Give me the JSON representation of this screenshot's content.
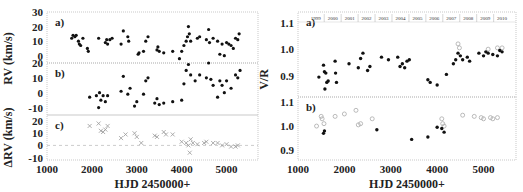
{
  "chart_data": [
    {
      "type": "scatter",
      "panel": "left",
      "xlabel": "HJD 2450000+",
      "xlim": [
        1000,
        5700
      ],
      "xticks": [
        1000,
        2000,
        3000,
        4000,
        5000
      ],
      "subplots": [
        {
          "label": "a)",
          "ylabel": "RV (km/s)",
          "ylim": [
            -5,
            30
          ],
          "yticks": [
            0,
            10,
            20,
            30
          ],
          "points": [
            [
              1550,
              12
            ],
            [
              1580,
              14
            ],
            [
              1620,
              13
            ],
            [
              1650,
              14
            ],
            [
              1700,
              10
            ],
            [
              1720,
              8
            ],
            [
              1750,
              7
            ],
            [
              1800,
              12
            ],
            [
              1900,
              5
            ],
            [
              1920,
              3
            ],
            [
              2150,
              12
            ],
            [
              2300,
              9
            ],
            [
              2330,
              11
            ],
            [
              2350,
              8
            ],
            [
              2400,
              11
            ],
            [
              2450,
              12
            ],
            [
              2650,
              8
            ],
            [
              2700,
              17
            ],
            [
              2800,
              13
            ],
            [
              2820,
              10
            ],
            [
              3030,
              1
            ],
            [
              3050,
              2
            ],
            [
              3150,
              3
            ],
            [
              3200,
              10
            ],
            [
              3250,
              13
            ],
            [
              3450,
              4
            ],
            [
              3470,
              6
            ],
            [
              3500,
              3
            ],
            [
              3600,
              2
            ],
            [
              3800,
              3
            ],
            [
              3950,
              -2
            ],
            [
              4000,
              3
            ],
            [
              4050,
              7
            ],
            [
              4100,
              10
            ],
            [
              4130,
              13
            ],
            [
              4150,
              20
            ],
            [
              4170,
              15
            ],
            [
              4200,
              10
            ],
            [
              4350,
              12
            ],
            [
              4400,
              13
            ],
            [
              4550,
              11
            ],
            [
              4600,
              18
            ],
            [
              4620,
              9
            ],
            [
              4700,
              12
            ],
            [
              4800,
              10
            ],
            [
              4850,
              1
            ],
            [
              4900,
              8
            ],
            [
              4950,
              0
            ],
            [
              5000,
              9
            ],
            [
              5050,
              8
            ],
            [
              5100,
              7
            ],
            [
              5150,
              5
            ],
            [
              5200,
              12
            ],
            [
              5250,
              11
            ],
            [
              5280,
              15
            ]
          ]
        },
        {
          "label": "b)",
          "ylabel": "",
          "ylim": [
            -15,
            20
          ],
          "yticks": [
            -10,
            0,
            10,
            20
          ],
          "points": [
            [
              1950,
              -3
            ],
            [
              2100,
              -2
            ],
            [
              2150,
              -10
            ],
            [
              2170,
              0
            ],
            [
              2200,
              -5
            ],
            [
              2250,
              -2
            ],
            [
              2300,
              -6
            ],
            [
              2350,
              -2
            ],
            [
              2650,
              1
            ],
            [
              2700,
              11
            ],
            [
              2800,
              -1
            ],
            [
              2850,
              3
            ],
            [
              2950,
              -9
            ],
            [
              3000,
              -6
            ],
            [
              3150,
              -1
            ],
            [
              3200,
              8
            ],
            [
              3250,
              10
            ],
            [
              3400,
              -7
            ],
            [
              3450,
              -4
            ],
            [
              3500,
              -8
            ],
            [
              3600,
              -7
            ],
            [
              3800,
              -6
            ],
            [
              4000,
              -5
            ],
            [
              4050,
              6
            ],
            [
              4100,
              15
            ],
            [
              4150,
              19
            ],
            [
              4200,
              12
            ],
            [
              4300,
              8
            ],
            [
              4400,
              12
            ],
            [
              4550,
              10
            ],
            [
              4600,
              20
            ],
            [
              4650,
              9
            ],
            [
              4700,
              5
            ],
            [
              4800,
              -3
            ],
            [
              4850,
              8
            ],
            [
              4900,
              5
            ],
            [
              4950,
              0
            ],
            [
              5000,
              8
            ],
            [
              5100,
              3
            ],
            [
              5200,
              12
            ],
            [
              5250,
              10
            ],
            [
              5300,
              15
            ]
          ]
        },
        {
          "label": "c)",
          "ylabel": "ΔRV (km/s)",
          "ylim": [
            -12,
            25
          ],
          "yticks": [
            -10,
            0,
            10,
            20
          ],
          "points": [
            [
              1950,
              16
            ],
            [
              2150,
              18
            ],
            [
              2200,
              12
            ],
            [
              2250,
              11
            ],
            [
              2300,
              13
            ],
            [
              2350,
              16
            ],
            [
              2650,
              6
            ],
            [
              2750,
              9
            ],
            [
              2950,
              10
            ],
            [
              3000,
              7
            ],
            [
              3100,
              2
            ],
            [
              3400,
              8
            ],
            [
              3450,
              7
            ],
            [
              3600,
              11
            ],
            [
              3650,
              9
            ],
            [
              3800,
              9
            ],
            [
              4000,
              3
            ],
            [
              4100,
              2
            ],
            [
              4150,
              0
            ],
            [
              4180,
              -6
            ],
            [
              4200,
              5
            ],
            [
              4250,
              2
            ],
            [
              4350,
              1
            ],
            [
              4500,
              2
            ],
            [
              4550,
              3
            ],
            [
              4700,
              2
            ],
            [
              4800,
              2
            ],
            [
              4900,
              0
            ],
            [
              5000,
              1
            ],
            [
              5100,
              -1
            ],
            [
              5200,
              -1
            ],
            [
              5250,
              0
            ]
          ]
        }
      ]
    },
    {
      "type": "scatter",
      "panel": "right",
      "xlabel": "HJD 2450000+",
      "xlim": [
        1000,
        5700
      ],
      "xticks": [
        1000,
        2000,
        3000,
        4000,
        5000
      ],
      "years": [
        "1999",
        "2000",
        "2001",
        "2002",
        "2003",
        "2004",
        "2005",
        "2006",
        "2007",
        "2008",
        "2009",
        "2010"
      ],
      "subplots": [
        {
          "label": "a)",
          "ylabel": "V/R",
          "ylim": [
            0.82,
            1.14
          ],
          "yticks": [
            0.9,
            1.0,
            1.1
          ],
          "filled": [
            [
              1450,
              0.895
            ],
            [
              1550,
              0.94
            ],
            [
              1570,
              0.915
            ],
            [
              1600,
              0.91
            ],
            [
              1620,
              0.875
            ],
            [
              1650,
              0.88
            ],
            [
              1580,
              0.85
            ],
            [
              1800,
              0.955
            ],
            [
              1810,
              0.91
            ],
            [
              1830,
              0.875
            ],
            [
              2100,
              0.945
            ],
            [
              2300,
              0.93
            ],
            [
              2350,
              0.965
            ],
            [
              2400,
              0.985
            ],
            [
              2500,
              0.92
            ],
            [
              2550,
              0.935
            ],
            [
              2800,
              0.97
            ],
            [
              2950,
              0.96
            ],
            [
              3150,
              0.97
            ],
            [
              3200,
              0.935
            ],
            [
              3250,
              0.945
            ],
            [
              3300,
              0.93
            ],
            [
              3350,
              0.955
            ],
            [
              3400,
              0.96
            ],
            [
              3800,
              0.885
            ],
            [
              3850,
              0.875
            ],
            [
              4000,
              0.865
            ],
            [
              4200,
              0.905
            ],
            [
              4350,
              0.945
            ],
            [
              4400,
              0.96
            ],
            [
              4450,
              0.985
            ],
            [
              4500,
              0.975
            ],
            [
              4550,
              0.96
            ],
            [
              4650,
              0.97
            ],
            [
              4700,
              0.955
            ],
            [
              4900,
              0.985
            ],
            [
              5000,
              0.975
            ],
            [
              5050,
              0.99
            ],
            [
              5100,
              0.985
            ],
            [
              5200,
              0.98
            ],
            [
              5300,
              0.975
            ],
            [
              5350,
              0.995
            ],
            [
              5400,
              0.99
            ]
          ],
          "open": [
            [
              4450,
              1.02
            ],
            [
              4480,
              1.005
            ],
            [
              5100,
              1.0
            ],
            [
              5300,
              1.005
            ],
            [
              5400,
              1.005
            ]
          ]
        },
        {
          "label": "b)",
          "ylabel": "",
          "ylim": [
            0.86,
            1.12
          ],
          "yticks": [
            0.9,
            1.0,
            1.1
          ],
          "filled": [
            [
              1550,
              0.97
            ],
            [
              1570,
              0.98
            ],
            [
              2700,
              0.985
            ],
            [
              3450,
              0.945
            ],
            [
              3800,
              0.955
            ],
            [
              4000,
              0.995
            ],
            [
              4100,
              0.99
            ],
            [
              4150,
              0.975
            ]
          ],
          "open": [
            [
              1400,
              1.0
            ],
            [
              1500,
              1.04
            ],
            [
              1520,
              1.03
            ],
            [
              1560,
              1.01
            ],
            [
              1800,
              1.04
            ],
            [
              2000,
              1.05
            ],
            [
              2250,
              1.065
            ],
            [
              2300,
              1.005
            ],
            [
              2350,
              1.01
            ],
            [
              2600,
              1.03
            ],
            [
              4100,
              1.03
            ],
            [
              4120,
              1.01
            ],
            [
              4150,
              1.0
            ],
            [
              4550,
              1.045
            ],
            [
              4800,
              1.04
            ],
            [
              4950,
              1.035
            ],
            [
              5000,
              1.03
            ],
            [
              5150,
              1.035
            ],
            [
              5200,
              1.03
            ],
            [
              5300,
              1.035
            ]
          ]
        }
      ]
    }
  ]
}
